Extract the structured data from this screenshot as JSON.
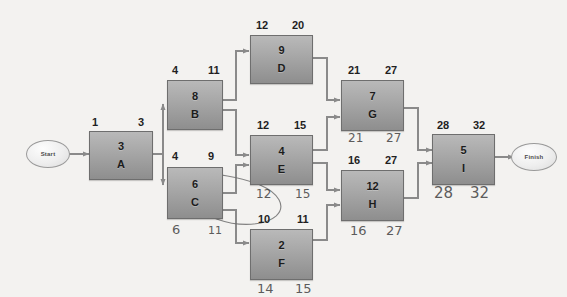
{
  "diagram": {
    "type": "network-diagram",
    "background_color": "#f3f2f0",
    "node_fill_color": "#a9a9a9",
    "connector_color": "#8a8a8a",
    "handwriting_color": "#3b3b3b"
  },
  "terminals": {
    "start": {
      "label": "Start"
    },
    "finish": {
      "label": "Finish"
    }
  },
  "nodes": [
    {
      "id": "A",
      "label": "A",
      "duration": "3",
      "es": "1",
      "ef": "3",
      "ls": "",
      "lf": ""
    },
    {
      "id": "B",
      "label": "B",
      "duration": "8",
      "es": "4",
      "ef": "11",
      "ls": "",
      "lf": ""
    },
    {
      "id": "C",
      "label": "C",
      "duration": "6",
      "es": "4",
      "ef": "9",
      "ls": "6",
      "lf": "11"
    },
    {
      "id": "D",
      "label": "D",
      "duration": "9",
      "es": "12",
      "ef": "20",
      "ls": "",
      "lf": ""
    },
    {
      "id": "E",
      "label": "E",
      "duration": "4",
      "es": "12",
      "ef": "15",
      "ls": "12",
      "lf": "15"
    },
    {
      "id": "F",
      "label": "F",
      "duration": "2",
      "es": "10",
      "ef": "11",
      "ls": "14",
      "lf": "15"
    },
    {
      "id": "G",
      "label": "G",
      "duration": "7",
      "es": "21",
      "ef": "27",
      "ls": "21",
      "lf": "27"
    },
    {
      "id": "H",
      "label": "H",
      "duration": "12",
      "es": "16",
      "ef": "27",
      "ls": "16",
      "lf": "27"
    },
    {
      "id": "I",
      "label": "I",
      "duration": "5",
      "es": "28",
      "ef": "32",
      "ls": "28",
      "lf": "32"
    }
  ],
  "edges": [
    {
      "from": "Start",
      "to": "A"
    },
    {
      "from": "A",
      "to": "B"
    },
    {
      "from": "A",
      "to": "C"
    },
    {
      "from": "B",
      "to": "D"
    },
    {
      "from": "B",
      "to": "E"
    },
    {
      "from": "C",
      "to": "E"
    },
    {
      "from": "C",
      "to": "F"
    },
    {
      "from": "D",
      "to": "G"
    },
    {
      "from": "E",
      "to": "G"
    },
    {
      "from": "E",
      "to": "H"
    },
    {
      "from": "F",
      "to": "H"
    },
    {
      "from": "G",
      "to": "I"
    },
    {
      "from": "H",
      "to": "I"
    },
    {
      "from": "I",
      "to": "Finish"
    }
  ],
  "annotations": {
    "ellipse": {
      "description": "hand-drawn ellipse circling the 9 above node C and the 10 above node F"
    }
  }
}
